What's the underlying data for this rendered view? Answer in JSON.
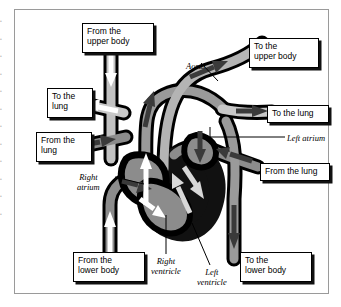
{
  "diagram": {
    "colors": {
      "vessel_outline": "#000000",
      "vessel_fill_dark": "#8c8c8c",
      "vessel_fill_light": "#c2c2c2",
      "chamber_black": "#111111",
      "arrow_white": "#ffffff",
      "arrow_dark": "#3a3a3a",
      "arrow_light": "#d8d8d8",
      "frame_border": "#9a9a9a",
      "page_background": "#ffffff"
    },
    "boxed_labels": [
      {
        "name": "from-the-upper-body",
        "text": "From the\nupper body",
        "x": 68,
        "y": 14,
        "w": 72,
        "h": 30
      },
      {
        "name": "to-the-upper-body",
        "text": "To the\nupper body",
        "x": 235,
        "y": 29,
        "w": 70,
        "h": 30
      },
      {
        "name": "to-the-lung-left",
        "text": "To the\nlung",
        "x": 33,
        "y": 79,
        "w": 46,
        "h": 30
      },
      {
        "name": "to-the-lung-right",
        "text": "To the lung",
        "x": 253,
        "y": 96,
        "w": 62,
        "h": 18
      },
      {
        "name": "from-the-lung-left",
        "text": "From the\nlung",
        "x": 22,
        "y": 123,
        "w": 56,
        "h": 30
      },
      {
        "name": "from-the-lung-right",
        "text": "From the lung",
        "x": 246,
        "y": 154,
        "w": 70,
        "h": 18
      },
      {
        "name": "from-the-lower-body",
        "text": "From the\nlower body",
        "x": 59,
        "y": 243,
        "w": 72,
        "h": 30
      },
      {
        "name": "to-the-lower-body",
        "text": "To the\nlower body",
        "x": 226,
        "y": 243,
        "w": 72,
        "h": 30
      }
    ],
    "leader_labels": [
      {
        "name": "aorta",
        "text": "Aorta",
        "x": 172,
        "y": 52,
        "align": "left"
      },
      {
        "name": "left-atrium",
        "text": "Left atrium",
        "x": 273,
        "y": 124,
        "align": "left"
      },
      {
        "name": "right-atrium",
        "text": "Right\natrium",
        "x": 63,
        "y": 163,
        "align": "center"
      },
      {
        "name": "right-ventricle",
        "text": "Right\nventricle",
        "x": 137,
        "y": 247,
        "align": "center"
      },
      {
        "name": "left-ventricle",
        "text": "Left\nventricle",
        "x": 183,
        "y": 258,
        "align": "center"
      }
    ]
  }
}
